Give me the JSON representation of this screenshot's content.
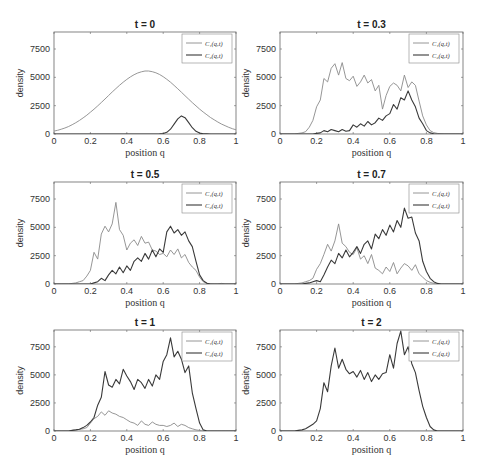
{
  "figure": {
    "xlabel": "position q",
    "ylabel": "density",
    "xticks": [
      "0",
      "0.2",
      "0.4",
      "0.6",
      "0.8",
      "1"
    ],
    "yticks": [
      "0",
      "2500",
      "5000",
      "7500"
    ],
    "legend": [
      "C₁(q,t)",
      "C₂(q,t)"
    ],
    "colors": {
      "c1": "#8a8a8a",
      "c2": "#3a3a3a",
      "axis": "#666666"
    }
  },
  "chart_data": [
    {
      "type": "line",
      "title": "t = 0",
      "xlabel": "position q",
      "ylabel": "density",
      "xlim": [
        0,
        1
      ],
      "ylim": [
        0,
        9000
      ],
      "x": [
        0,
        0.02,
        0.04,
        0.06,
        0.08,
        0.1,
        0.12,
        0.14,
        0.16,
        0.18,
        0.2,
        0.22,
        0.24,
        0.26,
        0.28,
        0.3,
        0.32,
        0.34,
        0.36,
        0.38,
        0.4,
        0.42,
        0.44,
        0.46,
        0.48,
        0.5,
        0.52,
        0.54,
        0.56,
        0.58,
        0.6,
        0.62,
        0.64,
        0.66,
        0.68,
        0.7,
        0.72,
        0.74,
        0.76,
        0.78,
        0.8,
        0.82,
        0.84,
        0.86,
        0.88,
        0.9,
        0.92,
        0.94,
        0.96,
        0.98,
        1
      ],
      "series": [
        {
          "name": "C₁(q,t)",
          "values": [
            260,
            330,
            420,
            530,
            660,
            820,
            1000,
            1200,
            1420,
            1660,
            1920,
            2190,
            2480,
            2780,
            3090,
            3400,
            3710,
            4010,
            4300,
            4570,
            4820,
            5040,
            5230,
            5380,
            5490,
            5560,
            5560,
            5500,
            5400,
            5250,
            5060,
            4830,
            4570,
            4290,
            3990,
            3690,
            3380,
            3070,
            2770,
            2480,
            2200,
            1940,
            1690,
            1460,
            1250,
            1060,
            880,
            730,
            590,
            470,
            370
          ]
        },
        {
          "name": "C₂(q,t)",
          "values": [
            0,
            0,
            0,
            0,
            0,
            0,
            0,
            0,
            0,
            0,
            0,
            0,
            0,
            0,
            0,
            0,
            0,
            0,
            0,
            0,
            0,
            0,
            0,
            0,
            0,
            0,
            0,
            0,
            0,
            10,
            40,
            150,
            420,
            870,
            1330,
            1600,
            1440,
            1000,
            560,
            240,
            80,
            20,
            5,
            0,
            0,
            0,
            0,
            0,
            0,
            0,
            0
          ]
        }
      ]
    },
    {
      "type": "line",
      "title": "t = 0.3",
      "xlabel": "position q",
      "ylabel": "density",
      "xlim": [
        0,
        1
      ],
      "ylim": [
        0,
        9000
      ],
      "x": [
        0,
        0.02,
        0.04,
        0.06,
        0.08,
        0.1,
        0.12,
        0.14,
        0.16,
        0.18,
        0.2,
        0.22,
        0.24,
        0.26,
        0.28,
        0.3,
        0.32,
        0.34,
        0.36,
        0.38,
        0.4,
        0.42,
        0.44,
        0.46,
        0.48,
        0.5,
        0.52,
        0.54,
        0.56,
        0.58,
        0.6,
        0.62,
        0.64,
        0.66,
        0.68,
        0.7,
        0.72,
        0.74,
        0.76,
        0.78,
        0.8,
        0.82,
        0.84,
        0.86,
        0.88,
        0.9,
        0.92,
        0.94,
        0.96,
        0.98,
        1
      ],
      "series": [
        {
          "name": "C₁(q,t)",
          "values": [
            0,
            0,
            0,
            0,
            0,
            50,
            100,
            200,
            600,
            1200,
            2400,
            3000,
            4900,
            4600,
            5800,
            6200,
            5200,
            6300,
            4900,
            4700,
            5100,
            4200,
            4600,
            5200,
            4500,
            4800,
            3800,
            4300,
            2200,
            3400,
            4200,
            4500,
            4300,
            3800,
            5200,
            4100,
            4600,
            4300,
            2900,
            1600,
            800,
            300,
            120,
            50,
            20,
            0,
            0,
            0,
            0,
            0,
            0
          ]
        },
        {
          "name": "C₂(q,t)",
          "values": [
            0,
            0,
            0,
            0,
            0,
            0,
            0,
            0,
            0,
            0,
            50,
            100,
            300,
            200,
            400,
            300,
            200,
            400,
            250,
            300,
            800,
            600,
            900,
            700,
            1100,
            800,
            1000,
            1400,
            1200,
            1600,
            1800,
            2600,
            2200,
            3200,
            3000,
            3800,
            3000,
            2400,
            1400,
            900,
            300,
            100,
            30,
            0,
            0,
            0,
            0,
            0,
            0,
            0,
            0
          ]
        }
      ]
    },
    {
      "type": "line",
      "title": "t = 0.5",
      "xlabel": "position q",
      "ylabel": "density",
      "xlim": [
        0,
        1
      ],
      "ylim": [
        0,
        9000
      ],
      "x": [
        0,
        0.02,
        0.04,
        0.06,
        0.08,
        0.1,
        0.12,
        0.14,
        0.16,
        0.18,
        0.2,
        0.22,
        0.24,
        0.26,
        0.28,
        0.3,
        0.32,
        0.34,
        0.36,
        0.38,
        0.4,
        0.42,
        0.44,
        0.46,
        0.48,
        0.5,
        0.52,
        0.54,
        0.56,
        0.58,
        0.6,
        0.62,
        0.64,
        0.66,
        0.68,
        0.7,
        0.72,
        0.74,
        0.76,
        0.78,
        0.8,
        0.82,
        0.84,
        0.86,
        0.88,
        0.9,
        0.92,
        0.94,
        0.96,
        0.98,
        1
      ],
      "series": [
        {
          "name": "C₁(q,t)",
          "values": [
            0,
            0,
            0,
            0,
            0,
            50,
            100,
            200,
            300,
            700,
            1200,
            2800,
            2200,
            4400,
            5100,
            4600,
            5300,
            7200,
            4800,
            4300,
            3000,
            3600,
            3900,
            3400,
            4200,
            3600,
            3700,
            3000,
            2900,
            2600,
            2700,
            2400,
            3000,
            2600,
            3100,
            2300,
            2600,
            1900,
            1500,
            1200,
            600,
            200,
            60,
            20,
            0,
            0,
            50,
            0,
            0,
            0,
            0
          ]
        },
        {
          "name": "C₂(q,t)",
          "values": [
            0,
            0,
            0,
            0,
            0,
            0,
            0,
            0,
            0,
            0,
            0,
            100,
            200,
            500,
            300,
            800,
            1200,
            900,
            1500,
            1000,
            1600,
            1200,
            2000,
            2300,
            2000,
            2700,
            2200,
            3000,
            2400,
            3100,
            2800,
            4600,
            5100,
            4500,
            4800,
            4300,
            4600,
            3800,
            3300,
            2000,
            800,
            300,
            60,
            0,
            0,
            0,
            0,
            0,
            0,
            0,
            0
          ]
        }
      ]
    },
    {
      "type": "line",
      "title": "t = 0.7",
      "xlabel": "position q",
      "ylabel": "density",
      "xlim": [
        0,
        1
      ],
      "ylim": [
        0,
        9000
      ],
      "x": [
        0,
        0.02,
        0.04,
        0.06,
        0.08,
        0.1,
        0.12,
        0.14,
        0.16,
        0.18,
        0.2,
        0.22,
        0.24,
        0.26,
        0.28,
        0.3,
        0.32,
        0.34,
        0.36,
        0.38,
        0.4,
        0.42,
        0.44,
        0.46,
        0.48,
        0.5,
        0.52,
        0.54,
        0.56,
        0.58,
        0.6,
        0.62,
        0.64,
        0.66,
        0.68,
        0.7,
        0.72,
        0.74,
        0.76,
        0.78,
        0.8,
        0.82,
        0.84,
        0.86,
        0.88,
        0.9,
        0.92,
        0.94,
        0.96,
        0.98,
        1
      ],
      "series": [
        {
          "name": "C₁(q,t)",
          "values": [
            0,
            0,
            0,
            0,
            0,
            50,
            100,
            200,
            300,
            500,
            1300,
            1800,
            2600,
            3500,
            2900,
            3800,
            5300,
            3600,
            3300,
            2800,
            2600,
            3200,
            2200,
            2500,
            1800,
            2600,
            1400,
            1200,
            900,
            1500,
            1100,
            1900,
            900,
            1400,
            1800,
            1600,
            1200,
            1700,
            900,
            600,
            300,
            150,
            50,
            0,
            0,
            0,
            0,
            0,
            0,
            0,
            0
          ]
        },
        {
          "name": "C₂(q,t)",
          "values": [
            0,
            0,
            0,
            0,
            0,
            0,
            0,
            50,
            100,
            200,
            300,
            200,
            800,
            1500,
            2100,
            1800,
            2700,
            2300,
            3000,
            2400,
            2800,
            3300,
            2700,
            3500,
            3800,
            3100,
            4400,
            4000,
            4800,
            4300,
            5200,
            4600,
            5600,
            5000,
            6700,
            5800,
            5900,
            4500,
            3800,
            2000,
            1100,
            500,
            200,
            50,
            0,
            0,
            0,
            0,
            0,
            0,
            0
          ]
        }
      ]
    },
    {
      "type": "line",
      "title": "t = 1",
      "xlabel": "position q",
      "ylabel": "density",
      "xlim": [
        0,
        1
      ],
      "ylim": [
        0,
        9000
      ],
      "x": [
        0,
        0.02,
        0.04,
        0.06,
        0.08,
        0.1,
        0.12,
        0.14,
        0.16,
        0.18,
        0.2,
        0.22,
        0.24,
        0.26,
        0.28,
        0.3,
        0.32,
        0.34,
        0.36,
        0.38,
        0.4,
        0.42,
        0.44,
        0.46,
        0.48,
        0.5,
        0.52,
        0.54,
        0.56,
        0.58,
        0.6,
        0.62,
        0.64,
        0.66,
        0.68,
        0.7,
        0.72,
        0.74,
        0.76,
        0.78,
        0.8,
        0.82,
        0.84,
        0.86,
        0.88,
        0.9,
        0.92,
        0.94,
        0.96,
        0.98,
        1
      ],
      "series": [
        {
          "name": "C₁(q,t)",
          "values": [
            0,
            0,
            0,
            0,
            0,
            50,
            100,
            150,
            200,
            300,
            700,
            1100,
            1300,
            1700,
            1400,
            1800,
            1600,
            1500,
            1300,
            1200,
            1000,
            800,
            700,
            500,
            900,
            600,
            500,
            800,
            600,
            500,
            500,
            400,
            500,
            700,
            400,
            600,
            500,
            300,
            200,
            100,
            50,
            0,
            0,
            0,
            0,
            0,
            0,
            0,
            0,
            0,
            0
          ]
        },
        {
          "name": "C₂(q,t)",
          "values": [
            0,
            0,
            0,
            0,
            0,
            50,
            100,
            150,
            300,
            500,
            800,
            1200,
            2300,
            3000,
            5300,
            4100,
            3900,
            4600,
            4200,
            5500,
            4900,
            4400,
            3700,
            4600,
            4300,
            3800,
            4600,
            4000,
            5000,
            4600,
            6200,
            6800,
            8300,
            6600,
            7100,
            6400,
            5200,
            5800,
            3400,
            2000,
            700,
            100,
            0,
            0,
            0,
            0,
            0,
            0,
            0,
            0,
            0
          ]
        }
      ]
    },
    {
      "type": "line",
      "title": "t = 2",
      "xlabel": "position q",
      "ylabel": "density",
      "xlim": [
        0,
        1
      ],
      "ylim": [
        0,
        9000
      ],
      "x": [
        0,
        0.02,
        0.04,
        0.06,
        0.08,
        0.1,
        0.12,
        0.14,
        0.16,
        0.18,
        0.2,
        0.22,
        0.24,
        0.26,
        0.28,
        0.3,
        0.32,
        0.34,
        0.36,
        0.38,
        0.4,
        0.42,
        0.44,
        0.46,
        0.48,
        0.5,
        0.52,
        0.54,
        0.56,
        0.58,
        0.6,
        0.62,
        0.64,
        0.66,
        0.68,
        0.7,
        0.72,
        0.74,
        0.76,
        0.78,
        0.8,
        0.82,
        0.84,
        0.86,
        0.88,
        0.9,
        0.92,
        0.94,
        0.96,
        0.98,
        1
      ],
      "series": [
        {
          "name": "C₁(q,t)",
          "values": [
            0,
            0,
            0,
            0,
            0,
            0,
            0,
            0,
            0,
            0,
            0,
            0,
            0,
            0,
            0,
            0,
            0,
            0,
            0,
            0,
            0,
            0,
            0,
            0,
            0,
            0,
            0,
            0,
            0,
            0,
            0,
            0,
            0,
            0,
            0,
            0,
            0,
            0,
            0,
            0,
            0,
            0,
            0,
            0,
            0,
            0,
            0,
            0,
            0,
            0,
            0
          ]
        },
        {
          "name": "C₂(q,t)",
          "values": [
            0,
            0,
            0,
            0,
            0,
            50,
            100,
            200,
            400,
            600,
            900,
            2000,
            4300,
            3500,
            5800,
            7400,
            5600,
            6400,
            5500,
            5100,
            5300,
            4800,
            5400,
            4600,
            5200,
            4400,
            5000,
            4600,
            5100,
            5200,
            6800,
            5600,
            7800,
            8900,
            6800,
            7500,
            6000,
            5200,
            3600,
            2200,
            1200,
            400,
            100,
            0,
            0,
            0,
            0,
            0,
            0,
            0,
            0
          ]
        }
      ]
    }
  ]
}
